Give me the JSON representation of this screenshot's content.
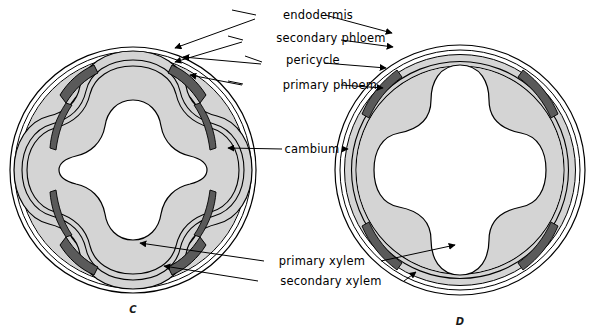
{
  "figure": {
    "background": "#ffffff",
    "width": 599,
    "height": 334
  },
  "colors": {
    "outline": "#000000",
    "tissue_fill": "#d4d4d4",
    "phloem_dark": "#5a5a5a",
    "background": "#ffffff",
    "label_text": "#000000"
  },
  "labels": [
    {
      "id": "endodermis",
      "text": "endodermis",
      "x": 318,
      "y": 19
    },
    {
      "id": "secondary-phloem",
      "text": "secondary phloem",
      "x": 331,
      "y": 42
    },
    {
      "id": "pericycle",
      "text": "pericycle",
      "x": 313,
      "y": 64
    },
    {
      "id": "primary-phloem",
      "text": "primary phloem",
      "x": 330,
      "y": 85
    },
    {
      "id": "cambium",
      "text": "cambium",
      "x": 312,
      "y": 149
    },
    {
      "id": "primary-xylem",
      "text": "primary xylem",
      "x": 322,
      "y": 261
    },
    {
      "id": "secondary-xylem",
      "text": "secondary xylem",
      "x": 331,
      "y": 281
    }
  ],
  "panels": [
    {
      "id": "C",
      "letter": "C",
      "letter_x": 133,
      "letter_y": 313,
      "cx": 133,
      "cy": 170,
      "r": 123,
      "caption": "Root with early secondary growth: lobed vascular cambium, four primary phloem strands, four-armed primary xylem"
    },
    {
      "id": "D",
      "letter": "D",
      "letter_x": 460,
      "letter_y": 325,
      "cx": 460,
      "cy": 170,
      "r": 125,
      "caption": "Root with extensive secondary growth: continuous cylindrical cambium, crushed primary phloem, thick secondary xylem"
    }
  ],
  "tissues": [
    {
      "name": "endodermis",
      "description": "outermost thin double line of each section"
    },
    {
      "name": "pericycle",
      "description": "thin line just inside the endodermis"
    },
    {
      "name": "secondary phloem",
      "description": "light band inside the pericycle"
    },
    {
      "name": "primary phloem",
      "description": "dark crushed patches at four diagonal positions"
    },
    {
      "name": "cambium",
      "description": "double contour line between phloem and xylem"
    },
    {
      "name": "primary xylem",
      "description": "white four-armed star at the centre"
    },
    {
      "name": "secondary xylem",
      "description": "shaded tissue between cambium and primary xylem"
    }
  ]
}
